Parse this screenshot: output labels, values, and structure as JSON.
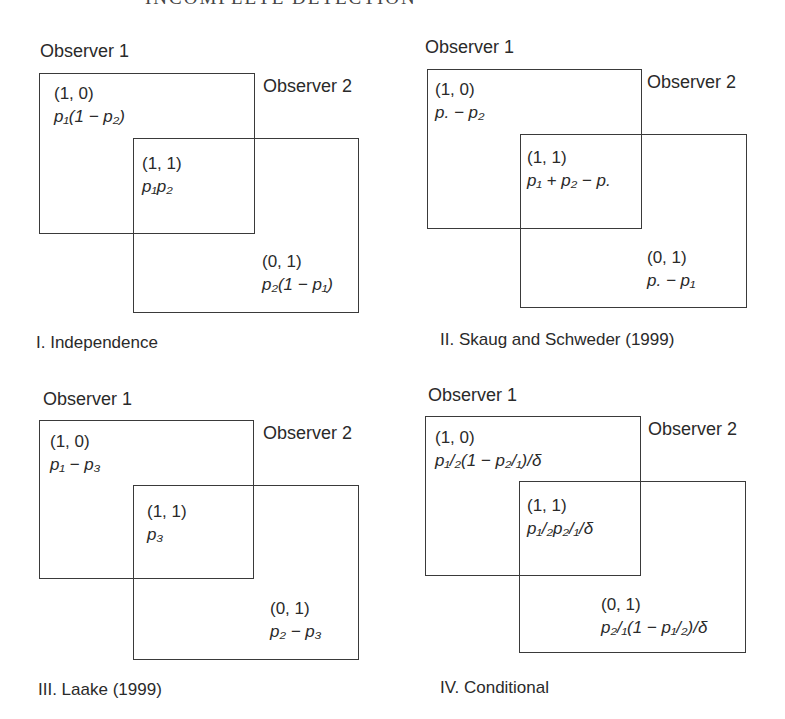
{
  "header": {
    "text": "INCOMPLETE DETECTION"
  },
  "panels": [
    {
      "caption": "I. Independence",
      "observer1_label": "Observer 1",
      "observer2_label": "Observer 2",
      "cells": {
        "only1": {
          "code": "(1, 0)",
          "formula": "p₁(1 − p₂)"
        },
        "both": {
          "code": "(1, 1)",
          "formula": "p₁p₂"
        },
        "only2": {
          "code": "(0, 1)",
          "formula": "p₂(1 − p₁)"
        }
      }
    },
    {
      "caption": "II. Skaug and Schweder (1999)",
      "observer1_label": "Observer 1",
      "observer2_label": "Observer 2",
      "cells": {
        "only1": {
          "code": "(1, 0)",
          "formula": "p. − p₂"
        },
        "both": {
          "code": "(1, 1)",
          "formula": "p₁ + p₂ − p."
        },
        "only2": {
          "code": "(0, 1)",
          "formula": "p. − p₁"
        }
      }
    },
    {
      "caption": "III. Laake (1999)",
      "observer1_label": "Observer 1",
      "observer2_label": "Observer 2",
      "cells": {
        "only1": {
          "code": "(1, 0)",
          "formula": "p₁ − p₃"
        },
        "both": {
          "code": "(1, 1)",
          "formula": "p₃"
        },
        "only2": {
          "code": "(0, 1)",
          "formula": "p₂ − p₃"
        }
      }
    },
    {
      "caption": "IV. Conditional",
      "observer1_label": "Observer 1",
      "observer2_label": "Observer 2",
      "cells": {
        "only1": {
          "code": "(1, 0)",
          "formula": "p₁/₂(1 − p₂/₁)/δ"
        },
        "both": {
          "code": "(1, 1)",
          "formula": "p₁/₂p₂/₁/δ"
        },
        "only2": {
          "code": "(0, 1)",
          "formula": "p₂/₁(1 − p₁/₂)/δ"
        }
      }
    }
  ]
}
